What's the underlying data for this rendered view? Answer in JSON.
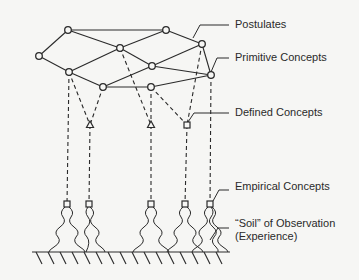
{
  "diagram": {
    "labels": {
      "postulates": "Postulates",
      "primitive_concepts": "Primitive Concepts",
      "defined_concepts": "Defined Concepts",
      "empirical_concepts": "Empirical Concepts",
      "soil_line1": "“Soil” of Observation",
      "soil_line2": "(Experience)"
    },
    "nodes": {
      "primitive": [
        [
          68,
          30
        ],
        [
          166,
          30
        ],
        [
          39,
          56
        ],
        [
          120,
          48
        ],
        [
          202,
          44
        ],
        [
          152,
          66
        ],
        [
          69,
          72
        ],
        [
          211,
          75
        ],
        [
          103,
          87
        ],
        [
          151,
          87
        ]
      ],
      "defined": [
        [
          90,
          125
        ],
        [
          151,
          125
        ],
        [
          187,
          125
        ]
      ],
      "empirical": [
        [
          67,
          204
        ],
        [
          89,
          204
        ],
        [
          151,
          204
        ],
        [
          185,
          204
        ],
        [
          210,
          204
        ]
      ]
    },
    "colors": {
      "ink": "#2a2a2a",
      "background": "#f6f6f4"
    }
  }
}
